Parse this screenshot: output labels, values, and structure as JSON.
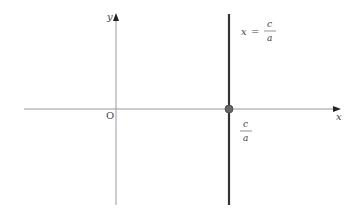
{
  "diagram": {
    "type": "coordinate-plane",
    "axes": {
      "x_label": "x",
      "y_label": "y",
      "origin_label": "O"
    },
    "vertical_line": {
      "equation_lhs": "x",
      "equation_eq": "=",
      "equation_num": "c",
      "equation_den": "a"
    },
    "intercept_point": {
      "label_num": "c",
      "label_den": "a"
    },
    "colors": {
      "axis": "#9a9a9a",
      "line": "#333333",
      "point_fill": "#666666",
      "point_stroke": "#444444",
      "text": "#444444"
    }
  }
}
